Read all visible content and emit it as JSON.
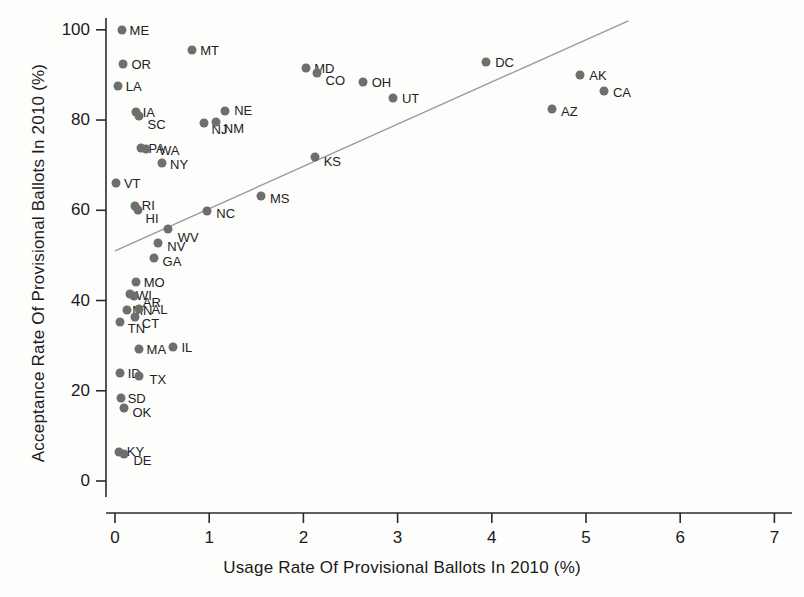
{
  "chart_data": {
    "type": "scatter",
    "title": "",
    "xlabel": "Usage Rate Of Provisional Ballots In 2010 (%)",
    "ylabel": "Acceptance Rate Of Provisional Ballots In 2010 (%)",
    "xlim": [
      0,
      7.25
    ],
    "ylim": [
      0,
      104
    ],
    "xticks": [
      0,
      1,
      2,
      3,
      4,
      5,
      6,
      7
    ],
    "yticks": [
      0,
      20,
      40,
      60,
      80,
      100
    ],
    "grid": false,
    "legend": null,
    "marker_color": "#6e6e6e",
    "line_color": "#9a9a9a",
    "trendline": {
      "label": "fitted regression line",
      "x0": 0.0,
      "y0": 51.0,
      "x1": 5.45,
      "y1": 102.0
    },
    "points": [
      {
        "label": "ME",
        "x": 0.07,
        "y": 100.0,
        "lx": 8,
        "ly": 0
      },
      {
        "label": "MT",
        "x": 0.82,
        "y": 95.5,
        "lx": 8,
        "ly": 0
      },
      {
        "label": "OR",
        "x": 0.09,
        "y": 92.5,
        "lx": 8,
        "ly": 0
      },
      {
        "label": "LA",
        "x": 0.03,
        "y": 87.5,
        "lx": 8,
        "ly": 0
      },
      {
        "label": "IA",
        "x": 0.22,
        "y": 81.8,
        "lx": 7,
        "ly": 0
      },
      {
        "label": "SC",
        "x": 0.25,
        "y": 81.0,
        "lx": 9,
        "ly": 8
      },
      {
        "label": "NE",
        "x": 1.17,
        "y": 82.0,
        "lx": 9,
        "ly": -1
      },
      {
        "label": "NJ",
        "x": 0.94,
        "y": 79.3,
        "lx": 8,
        "ly": 6
      },
      {
        "label": "NM",
        "x": 1.07,
        "y": 79.5,
        "lx": 8,
        "ly": 6
      },
      {
        "label": "MD",
        "x": 2.03,
        "y": 91.5,
        "lx": 8,
        "ly": 0
      },
      {
        "label": "CO",
        "x": 2.14,
        "y": 90.5,
        "lx": 9,
        "ly": 7
      },
      {
        "label": "OH",
        "x": 2.63,
        "y": 88.5,
        "lx": 9,
        "ly": 0
      },
      {
        "label": "UT",
        "x": 2.95,
        "y": 84.8,
        "lx": 9,
        "ly": 0
      },
      {
        "label": "DC",
        "x": 3.94,
        "y": 92.8,
        "lx": 9,
        "ly": 0
      },
      {
        "label": "AK",
        "x": 4.94,
        "y": 90.0,
        "lx": 9,
        "ly": 0
      },
      {
        "label": "CA",
        "x": 5.19,
        "y": 86.5,
        "lx": 9,
        "ly": 1
      },
      {
        "label": "AZ",
        "x": 4.64,
        "y": 82.4,
        "lx": 9,
        "ly": 2
      },
      {
        "label": "PA",
        "x": 0.28,
        "y": 73.8,
        "lx": 7,
        "ly": 0
      },
      {
        "label": "WA",
        "x": 0.33,
        "y": 73.5,
        "lx": 13,
        "ly": 1
      },
      {
        "label": "NY",
        "x": 0.5,
        "y": 70.5,
        "lx": 8,
        "ly": 1
      },
      {
        "label": "KS",
        "x": 2.12,
        "y": 71.8,
        "lx": 9,
        "ly": 4
      },
      {
        "label": "VT",
        "x": 0.01,
        "y": 66.0,
        "lx": 8,
        "ly": 0
      },
      {
        "label": "MS",
        "x": 1.55,
        "y": 63.2,
        "lx": 9,
        "ly": 2
      },
      {
        "label": "RI",
        "x": 0.21,
        "y": 61.0,
        "lx": 7,
        "ly": -1
      },
      {
        "label": "HI",
        "x": 0.24,
        "y": 60.0,
        "lx": 8,
        "ly": 8
      },
      {
        "label": "NC",
        "x": 0.98,
        "y": 59.8,
        "lx": 9,
        "ly": 2
      },
      {
        "label": "WV",
        "x": 0.56,
        "y": 55.8,
        "lx": 10,
        "ly": 8
      },
      {
        "label": "NV",
        "x": 0.46,
        "y": 52.8,
        "lx": 9,
        "ly": 3
      },
      {
        "label": "GA",
        "x": 0.41,
        "y": 49.5,
        "lx": 9,
        "ly": 3
      },
      {
        "label": "MO",
        "x": 0.22,
        "y": 44.2,
        "lx": 8,
        "ly": 0
      },
      {
        "label": "WI",
        "x": 0.16,
        "y": 41.5,
        "lx": 6,
        "ly": 1
      },
      {
        "label": "AR",
        "x": 0.2,
        "y": 41.0,
        "lx": 9,
        "ly": 6
      },
      {
        "label": "MN",
        "x": 0.13,
        "y": 38.0,
        "lx": 5,
        "ly": 0
      },
      {
        "label": "AL",
        "x": 0.26,
        "y": 38.2,
        "lx": 12,
        "ly": 0
      },
      {
        "label": "CT",
        "x": 0.21,
        "y": 36.4,
        "lx": 7,
        "ly": 6
      },
      {
        "label": "TN",
        "x": 0.05,
        "y": 35.2,
        "lx": 8,
        "ly": 6
      },
      {
        "label": "MA",
        "x": 0.25,
        "y": 29.3,
        "lx": 8,
        "ly": 0
      },
      {
        "label": "IL",
        "x": 0.62,
        "y": 29.8,
        "lx": 8,
        "ly": 0
      },
      {
        "label": "ID",
        "x": 0.05,
        "y": 24.0,
        "lx": 8,
        "ly": 0
      },
      {
        "label": "TX",
        "x": 0.26,
        "y": 23.3,
        "lx": 10,
        "ly": 3
      },
      {
        "label": "SD",
        "x": 0.06,
        "y": 18.3,
        "lx": 7,
        "ly": 0
      },
      {
        "label": "OK",
        "x": 0.1,
        "y": 16.2,
        "lx": 8,
        "ly": 4
      },
      {
        "label": "KY",
        "x": 0.04,
        "y": 6.5,
        "lx": 8,
        "ly": -1
      },
      {
        "label": "DE",
        "x": 0.1,
        "y": 6.0,
        "lx": 9,
        "ly": 6
      }
    ]
  }
}
